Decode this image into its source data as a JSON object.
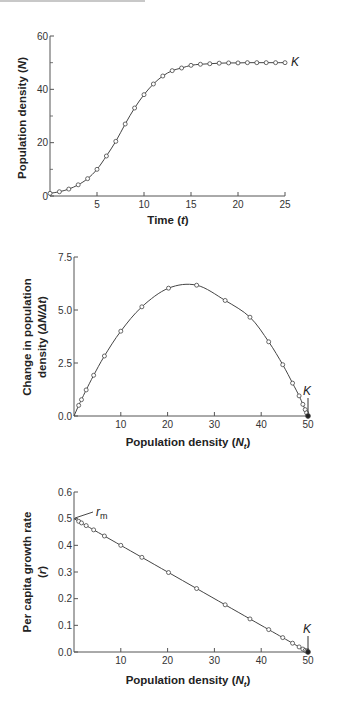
{
  "chart_data": [
    {
      "type": "line",
      "title": "",
      "xlabel": "Time (t)",
      "ylabel": "Population density (N)",
      "xlim": [
        0,
        25
      ],
      "ylim": [
        0,
        60
      ],
      "xticks": [
        5,
        10,
        15,
        20,
        25
      ],
      "yticks": [
        0,
        20,
        40,
        60
      ],
      "grid": false,
      "annotations": [
        {
          "text": "K",
          "x": 25,
          "y": 50
        }
      ],
      "series": [
        {
          "name": "N",
          "x": [
            0,
            1,
            2,
            3,
            4,
            5,
            6,
            7,
            8,
            9,
            10,
            11,
            12,
            13,
            14,
            15,
            16,
            17,
            18,
            19,
            20,
            21,
            22,
            23,
            24,
            25
          ],
          "values": [
            1,
            1.6,
            2.6,
            4.2,
            6.5,
            10,
            15,
            20.5,
            27,
            33,
            38,
            42,
            45,
            47,
            48,
            49,
            49.4,
            49.6,
            49.8,
            49.9,
            49.9,
            50,
            50,
            50,
            50,
            50
          ]
        }
      ]
    },
    {
      "type": "line",
      "title": "",
      "xlabel": "Population density (Nt)",
      "ylabel": "Change in population density (ΔN/Δt)",
      "xlim": [
        0,
        50
      ],
      "ylim": [
        0,
        7.5
      ],
      "xticks": [
        10,
        20,
        30,
        40,
        50
      ],
      "yticks": [
        0.0,
        2.5,
        5.0,
        7.5
      ],
      "grid": false,
      "annotations": [
        {
          "text": "K",
          "x": 50,
          "y": 0
        }
      ],
      "series": [
        {
          "name": "ΔN/Δt",
          "x": [
            1,
            1.6,
            2.6,
            4.2,
            6.5,
            10,
            14.5,
            20.2,
            26.2,
            32.3,
            37.6,
            41.6,
            44.6,
            46.7,
            48.1,
            48.9,
            49.4,
            49.7,
            50
          ],
          "values": [
            0.5,
            0.77,
            1.23,
            1.92,
            2.83,
            4.0,
            5.15,
            6.03,
            6.17,
            5.45,
            4.66,
            3.5,
            2.42,
            1.55,
            0.95,
            0.55,
            0.3,
            0.15,
            0.0
          ]
        }
      ]
    },
    {
      "type": "line",
      "title": "",
      "xlabel": "Population density (Nt)",
      "ylabel": "Per capita growth rate (r)",
      "xlim": [
        0,
        50
      ],
      "ylim": [
        0,
        0.6
      ],
      "xticks": [
        10,
        20,
        30,
        40,
        50
      ],
      "yticks": [
        0.0,
        0.1,
        0.2,
        0.3,
        0.4,
        0.5,
        0.6
      ],
      "grid": false,
      "annotations": [
        {
          "text": "rm",
          "x": 0,
          "y": 0.5
        },
        {
          "text": "K",
          "x": 50,
          "y": 0
        }
      ],
      "series": [
        {
          "name": "r",
          "x": [
            1,
            1.6,
            2.6,
            4.2,
            6.5,
            10,
            14.5,
            20.2,
            26.2,
            32.3,
            37.6,
            41.6,
            44.6,
            46.7,
            48.1,
            48.9,
            49.4,
            49.7,
            50
          ],
          "values": [
            0.49,
            0.484,
            0.474,
            0.458,
            0.435,
            0.4,
            0.355,
            0.298,
            0.238,
            0.177,
            0.124,
            0.084,
            0.054,
            0.033,
            0.019,
            0.011,
            0.006,
            0.003,
            0.0
          ]
        }
      ]
    }
  ],
  "charts": {
    "c1": {
      "xlabel_main": "Time (",
      "xlabel_var": "t",
      "xlabel_end": ")",
      "ylabel_main": "Population density (",
      "ylabel_var": "N",
      "ylabel_end": ")",
      "k_label": "K",
      "xtick_labels": [
        "5",
        "10",
        "15",
        "20",
        "25"
      ],
      "ytick_labels": [
        "0",
        "20",
        "40",
        "60"
      ]
    },
    "c2": {
      "xlabel_main": "Population density (",
      "xlabel_var": "N",
      "xlabel_sub": "t",
      "xlabel_end": ")",
      "ylabel_line1": "Change in population",
      "ylabel_line2_main": "density (",
      "ylabel_line2_var": "ΔN/Δt",
      "ylabel_line2_end": ")",
      "k_label": "K",
      "xtick_labels": [
        "10",
        "20",
        "30",
        "40",
        "50"
      ],
      "ytick_labels": [
        "0.0",
        "2.5",
        "5.0",
        "7.5"
      ]
    },
    "c3": {
      "xlabel_main": "Population density (",
      "xlabel_var": "N",
      "xlabel_sub": "t",
      "xlabel_end": ")",
      "ylabel_line1": "Per capita growth rate",
      "ylabel_line2_main": "(",
      "ylabel_line2_var": "r",
      "ylabel_line2_end": ")",
      "k_label": "K",
      "rm_label": "r",
      "rm_sub": "m",
      "xtick_labels": [
        "10",
        "20",
        "30",
        "40",
        "50"
      ],
      "ytick_labels": [
        "0.0",
        "0.1",
        "0.2",
        "0.3",
        "0.4",
        "0.5",
        "0.6"
      ]
    }
  },
  "colors": {
    "line": "#444444",
    "marker_fill": "#ffffff",
    "axis": "#555555",
    "text": "#222222"
  }
}
